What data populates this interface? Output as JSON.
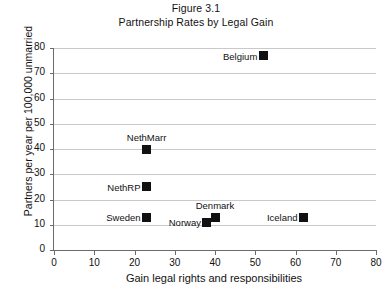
{
  "chart_data": {
    "type": "scatter",
    "title": "Figure 3.1",
    "subtitle": "Partnership Rates by Legal Gain",
    "xlabel": "Gain legal rights and responsibilities",
    "ylabel": "Partners per year per 100,000 unmarried",
    "xlim": [
      0,
      80
    ],
    "ylim": [
      0,
      80
    ],
    "xticks": [
      0,
      10,
      20,
      30,
      40,
      50,
      60,
      70,
      80
    ],
    "yticks": [
      0,
      10,
      20,
      30,
      40,
      50,
      60,
      70,
      80
    ],
    "grid": "horizontal",
    "legend": "none",
    "marker_color": "#111111",
    "gridline_color": "#c9c9c9",
    "axis_color": "#6b6b6b",
    "points": [
      {
        "label": "Belgium",
        "x": 52,
        "y": 77,
        "label_pos": "right"
      },
      {
        "label": "NethMarr",
        "x": 23,
        "y": 40,
        "label_pos": "above"
      },
      {
        "label": "NethRP",
        "x": 23,
        "y": 25,
        "label_pos": "right"
      },
      {
        "label": "Sweden",
        "x": 23,
        "y": 13,
        "label_pos": "right"
      },
      {
        "label": "Norway",
        "x": 38,
        "y": 11,
        "label_pos": "right"
      },
      {
        "label": "Denmark",
        "x": 40,
        "y": 13,
        "label_pos": "above"
      },
      {
        "label": "Iceland",
        "x": 62,
        "y": 13,
        "label_pos": "right"
      }
    ]
  }
}
